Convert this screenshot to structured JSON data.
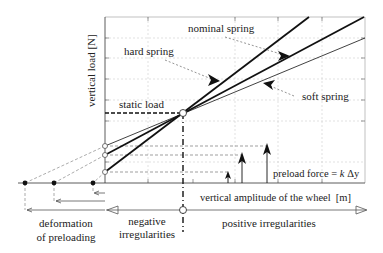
{
  "diagram": {
    "y_axis_label": "vertical load [N]",
    "x_axis_label": "vertical amplitude of the wheel  [m]",
    "labels": {
      "nominal_spring": "nominal spring",
      "hard_spring": "hard spring",
      "soft_spring": "soft spring",
      "static_load": "static load",
      "preload_force": "preload force = k Δy",
      "preload_force_prefix": "preload force =",
      "preload_force_k": "k",
      "preload_force_dy": "Δy",
      "deformation_line1": "deformation",
      "deformation_line2": "of preloading",
      "negative_line1": "negative",
      "negative_line2": "irregularities",
      "positive": "positive irregularities"
    },
    "springs": [
      {
        "name": "hard spring",
        "style": "thick"
      },
      {
        "name": "nominal spring",
        "style": "thick"
      },
      {
        "name": "soft spring",
        "style": "thin"
      }
    ],
    "colors": {
      "line": "#1a1a1a",
      "grid": "#c8c8c8",
      "dashed": "#777777"
    }
  }
}
